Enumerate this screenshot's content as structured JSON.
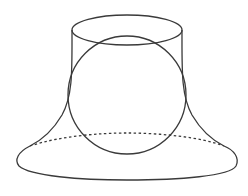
{
  "figure": {
    "stroke_color": "#3a3a3a",
    "background": "#ffffff",
    "top_ellipse": {
      "cx": 127,
      "cy": 30,
      "rx": 55,
      "ry": 15
    },
    "bottom_ellipse": {
      "cx": 127,
      "cy": 160,
      "rx": 110,
      "ry": 20,
      "back_half": "dashed"
    },
    "sphere": {
      "cx": 127,
      "cy": 95,
      "r": 59
    }
  }
}
